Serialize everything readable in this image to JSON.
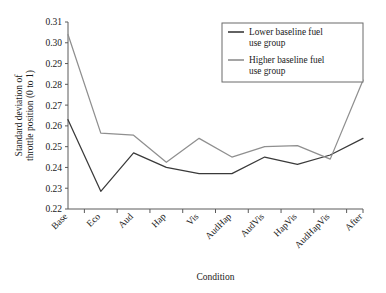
{
  "chart_data": {
    "type": "line",
    "title": "",
    "xlabel": "Condition",
    "ylabel": "Standard deviation of throttle position (0 to 1)",
    "ylabel_line1": "Standard deviation of",
    "ylabel_line2": "throttle position (0 to 1)",
    "categories": [
      "Base",
      "Eco",
      "Aud",
      "Hap",
      "Vis",
      "AudHap",
      "AudVis",
      "HapVis",
      "AudHapVis",
      "After"
    ],
    "ylim": [
      0.22,
      0.31
    ],
    "ytick_step": 0.01,
    "ytick_labels": [
      "0.22",
      "0.23",
      "0.24",
      "0.25",
      "0.26",
      "0.27",
      "0.28",
      "0.29",
      "0.30",
      "0.31"
    ],
    "ytick_values": [
      0.22,
      0.23,
      0.24,
      0.25,
      0.26,
      0.27,
      0.28,
      0.29,
      0.3,
      0.31
    ],
    "grid": false,
    "legend_position": "top-right",
    "series": [
      {
        "name": "Lower baseline fuel use group",
        "legend_line1": "Lower baseline fuel",
        "legend_line2": "use group",
        "color": "#3a3a3a",
        "values": [
          0.263,
          0.2285,
          0.247,
          0.24,
          0.237,
          0.237,
          0.245,
          0.2415,
          0.246,
          0.254
        ]
      },
      {
        "name": "Higher baseline fuel use group",
        "legend_line1": "Higher baseline fuel",
        "legend_line2": "use group",
        "color": "#8f8f8f",
        "values": [
          0.304,
          0.2565,
          0.2555,
          0.2425,
          0.254,
          0.245,
          0.25,
          0.2505,
          0.244,
          0.282
        ]
      }
    ]
  },
  "colors": {
    "axis": "#5a5a5a",
    "text": "#1a1a1a",
    "background": "#ffffff",
    "legend_border": "#6b6b6b"
  }
}
